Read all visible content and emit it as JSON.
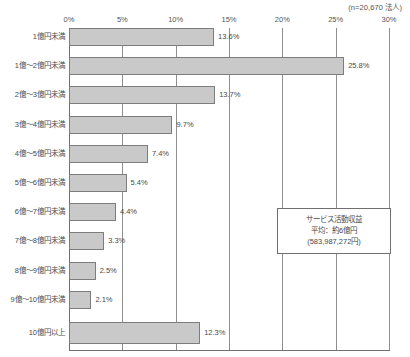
{
  "sample_note": "(n=20,670 法人)",
  "callout": {
    "title": "サービス活動収益",
    "average": "平均：約6億円",
    "amount": "(583,987,272円)"
  },
  "chart_data": {
    "type": "bar",
    "orientation": "horizontal",
    "title": "",
    "subtitle": "",
    "xlabel": "",
    "ylabel": "",
    "xlim": [
      0,
      30
    ],
    "xticks": [
      "0%",
      "5%",
      "10%",
      "15%",
      "20%",
      "25%",
      "30%"
    ],
    "xtick_values": [
      0,
      5,
      10,
      15,
      20,
      25,
      30
    ],
    "grid": true,
    "legend": false,
    "categories": [
      "1億円未満",
      "1億～2億円未満",
      "2億～3億円未満",
      "3億～4億円未満",
      "4億～5億円未満",
      "5億～6億円未満",
      "6億～7億円未満",
      "7億～8億円未満",
      "8億～9億円未満",
      "9億～10億円未満",
      "10億円以上"
    ],
    "values": [
      13.6,
      25.8,
      13.7,
      9.7,
      7.4,
      5.4,
      4.4,
      3.3,
      2.5,
      2.1,
      12.3
    ],
    "value_labels": [
      "13.6%",
      "25.8%",
      "13.7%",
      "9.7%",
      "7.4%",
      "5.4%",
      "4.4%",
      "3.3%",
      "2.5%",
      "2.1%",
      "12.3%"
    ],
    "bar_color": "#c9c9c9",
    "bar_border_color": "#7d7d7d",
    "annotations": [
      "(n=20,670 法人)",
      "サービス活動収益 平均：約6億円 (583,987,272円)"
    ]
  }
}
